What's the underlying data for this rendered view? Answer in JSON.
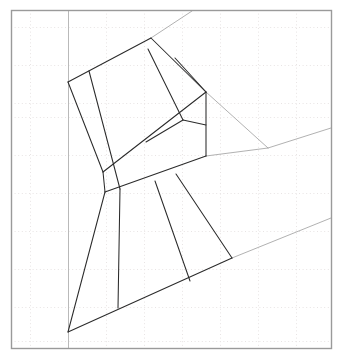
{
  "figure": {
    "title": "",
    "type": "line-drawing",
    "canvas": {
      "width": 342,
      "height": 362,
      "background": "#ffffff"
    },
    "colors": {
      "frame": "#9a9a9a",
      "grid_major": "#d8d8d8",
      "grid_minor": "#e8e4e4",
      "dark_line": "#2b2b2b",
      "light_line": "#8f8f8f",
      "guide_line": "#a8a8a8"
    },
    "frame": {
      "x": 11,
      "y": 10,
      "width": 320,
      "height": 338,
      "stroke_width": 1.4
    },
    "grid": {
      "enabled": true,
      "style": "dotted",
      "spacing": 38,
      "x_lines": [
        30,
        68,
        106,
        144,
        182,
        220,
        258,
        296
      ],
      "y_lines": [
        27,
        65,
        103,
        117,
        155,
        193,
        231,
        269,
        307,
        341
      ]
    },
    "vertical_guide": {
      "x": 68,
      "y1": 10,
      "y2": 348,
      "color": "#b9b9b9"
    },
    "shapes": {
      "outer_polygon": {
        "name": "main-outline",
        "points": "68,82 151,38 206,92 206,156 120,308 68,332"
      },
      "upper_band": {
        "name": "upper-band",
        "points": "69,82 151,38 206,92 103,172"
      },
      "mid_band": {
        "name": "middle-band",
        "points": "103,172 206,92 206,156 105,192"
      },
      "lower_region": {
        "name": "lower-region",
        "points": "105,192 206,156 232,258 118,308 68,332"
      }
    },
    "dark_segments": [
      {
        "name": "seg-left-upper",
        "x1": 68,
        "y1": 82,
        "x2": 103,
        "y2": 172
      },
      {
        "name": "seg-left-mid",
        "x1": 103,
        "y1": 172,
        "x2": 105,
        "y2": 192
      },
      {
        "name": "seg-left-lower",
        "x1": 105,
        "y1": 192,
        "x2": 68,
        "y2": 332
      },
      {
        "name": "seg-top-left",
        "x1": 68,
        "y1": 82,
        "x2": 151,
        "y2": 38
      },
      {
        "name": "seg-top-right",
        "x1": 151,
        "y1": 38,
        "x2": 206,
        "y2": 92
      },
      {
        "name": "seg-right-upper",
        "x1": 206,
        "y1": 92,
        "x2": 206,
        "y2": 156
      },
      {
        "name": "seg-bottom-edge",
        "x1": 68,
        "y1": 332,
        "x2": 232,
        "y2": 258
      },
      {
        "name": "divider-upper-1",
        "x1": 89,
        "y1": 71,
        "x2": 120,
        "y2": 189
      },
      {
        "name": "divider-upper-2",
        "x1": 103,
        "y1": 172,
        "x2": 206,
        "y2": 92
      },
      {
        "name": "divider-upper-3",
        "x1": 148,
        "y1": 49,
        "x2": 183,
        "y2": 120
      },
      {
        "name": "divider-upper-4",
        "x1": 175,
        "y1": 58,
        "x2": 206,
        "y2": 92
      },
      {
        "name": "divider-mid-1",
        "x1": 183,
        "y1": 120,
        "x2": 206,
        "y2": 125
      },
      {
        "name": "divider-mid-2",
        "x1": 146,
        "y1": 142,
        "x2": 183,
        "y2": 120
      },
      {
        "name": "divider-mid-3",
        "x1": 105,
        "y1": 192,
        "x2": 206,
        "y2": 156
      },
      {
        "name": "divider-lower-1",
        "x1": 155,
        "y1": 181,
        "x2": 190,
        "y2": 281
      },
      {
        "name": "divider-lower-2",
        "x1": 176,
        "y1": 174,
        "x2": 232,
        "y2": 258
      },
      {
        "name": "divider-lower-3",
        "x1": 118,
        "y1": 308,
        "x2": 120,
        "y2": 189
      }
    ],
    "guide_segments": [
      {
        "name": "guide-top-extension",
        "x1": 151,
        "y1": 38,
        "x2": 192,
        "y2": 11
      },
      {
        "name": "guide-right-diagonal",
        "x1": 206,
        "y1": 92,
        "x2": 268,
        "y2": 148
      },
      {
        "name": "guide-right-upper",
        "x1": 268,
        "y1": 148,
        "x2": 331,
        "y2": 128
      },
      {
        "name": "guide-right-lower",
        "x1": 232,
        "y1": 258,
        "x2": 331,
        "y2": 218
      },
      {
        "name": "guide-mid-to-right",
        "x1": 206,
        "y1": 156,
        "x2": 268,
        "y2": 148
      }
    ]
  }
}
